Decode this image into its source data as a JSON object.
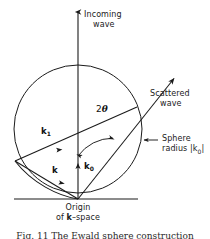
{
  "figure": {
    "domain_type": "diagram",
    "background_color": "#ffffff",
    "stroke_color": "#1a1a1a",
    "text_color": "#1a1a1a"
  },
  "labels": {
    "incoming_wave_line1": "Incoming",
    "incoming_wave_line2": "wave",
    "scattered_wave_line1": "Scattered",
    "scattered_wave_line2": "wave",
    "sphere_radius_line1": "Sphere",
    "sphere_radius_line2_prefix": "radius |k",
    "sphere_radius_line2_sub": "0",
    "sphere_radius_line2_suffix": "|",
    "origin_line1": "Origin",
    "origin_line2_prefix": "of ",
    "origin_line2_k": "k",
    "origin_line2_suffix": "–space",
    "angle_two_theta_prefix": "2",
    "angle_two_theta_symbol": "θ"
  },
  "vectors": {
    "k1_symbol": "k",
    "k1_subscript": "1",
    "k0_symbol": "k",
    "k0_subscript": "0",
    "k_symbol": "k"
  },
  "caption": {
    "text": "Fig. 11  The Ewald sphere construction"
  },
  "geometry": {
    "circle_center_x": 78,
    "circle_center_y": 129,
    "circle_radius": 64,
    "origin_x": 78,
    "origin_y": 199,
    "vertical_axis_top_y": 9,
    "scattered_ray_tip_x": 176,
    "scattered_ray_tip_y": 77,
    "left_intersection_x": 15,
    "left_intersection_y": 161,
    "baseline_y": 199,
    "baseline_x_start": 14,
    "baseline_x_end": 138
  }
}
